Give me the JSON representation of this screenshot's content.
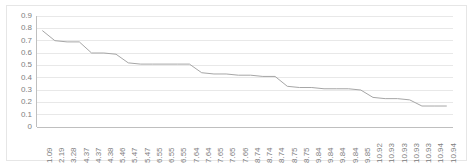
{
  "chart_data": {
    "type": "line",
    "title": "",
    "subtitle": "",
    "xlabel": "",
    "ylabel": "",
    "grid": true,
    "legend": false,
    "legend_position": "none",
    "line_color": "#a6a6a6",
    "gridline_color": "#e8e8e8",
    "axis_color": "#bfbfbf",
    "tick_text_color": "#808080",
    "background_color": "#ffffff",
    "border_color": "#e6e6e6",
    "ylim": [
      0,
      0.9
    ],
    "ytick_step": 0.1,
    "ytick_labels": [
      "0.9",
      "0.8",
      "0.7",
      "0.6",
      "0.5",
      "0.4",
      "0.3",
      "0.2",
      "0.1",
      "0"
    ],
    "ytick_values": [
      0.9,
      0.8,
      0.7,
      0.6,
      0.5,
      0.4,
      0.3,
      0.2,
      0.1,
      0
    ],
    "categories": [
      "1.09",
      "2.19",
      "3.28",
      "4.37",
      "4.37",
      "4.38",
      "5.46",
      "5.47",
      "5.47",
      "6.55",
      "6.55",
      "6.55",
      "7.64",
      "7.64",
      "7.65",
      "7.65",
      "7.66",
      "8.74",
      "8.74",
      "8.74",
      "8.75",
      "8.75",
      "9.84",
      "9.84",
      "9.84",
      "9.84",
      "9.85",
      "10.92",
      "10.93",
      "10.93",
      "10.93",
      "10.93",
      "10.94",
      "10.94"
    ],
    "values": [
      0.78,
      0.7,
      0.69,
      0.69,
      0.6,
      0.6,
      0.59,
      0.52,
      0.51,
      0.51,
      0.51,
      0.51,
      0.51,
      0.44,
      0.43,
      0.43,
      0.42,
      0.42,
      0.41,
      0.41,
      0.33,
      0.32,
      0.32,
      0.31,
      0.31,
      0.31,
      0.3,
      0.24,
      0.23,
      0.23,
      0.22,
      0.17,
      0.17,
      0.17
    ]
  }
}
